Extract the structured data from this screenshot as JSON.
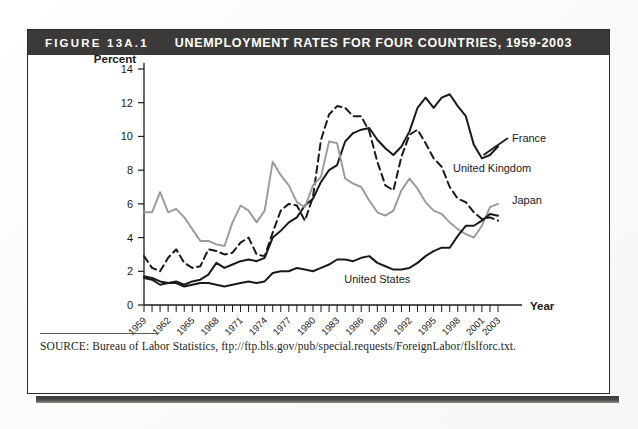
{
  "figure": {
    "number_label": "FIGURE 13A.1",
    "title": "UNEMPLOYMENT RATES FOR FOUR COUNTRIES, 1959-2003",
    "source": "SOURCE: Bureau of Labor Statistics, ftp://ftp.bls.gov/pub/special.requests/ForeignLabor/flslforc.txt."
  },
  "colors": {
    "header_bar": "#3c3a38",
    "header_text": "#ffffff",
    "frame": "#2b2b2b",
    "axis": "#1a1a1a",
    "france": "#1a1a1a",
    "united_kingdom": "#1a1a1a",
    "japan": "#9a9a9a",
    "united_states": "#1a1a1a"
  },
  "chart_data": {
    "type": "line",
    "title": "Unemployment Rates for Four Countries, 1959-2003",
    "xlabel": "Year",
    "ylabel": "Percent",
    "ylim": [
      0,
      14
    ],
    "yticks": [
      0,
      2,
      4,
      6,
      8,
      10,
      12,
      14
    ],
    "xlim": [
      1959,
      2003
    ],
    "xticks": [
      1959,
      1962,
      1965,
      1968,
      1971,
      1974,
      1977,
      1980,
      1983,
      1986,
      1989,
      1992,
      1995,
      1998,
      2001,
      2003
    ],
    "xtick_labels": [
      "1959",
      "1962",
      "1965",
      "1968",
      "1971",
      "1974",
      "1977",
      "1980",
      "1983",
      "1986",
      "1989",
      "1992",
      "1995",
      "1998",
      "2001",
      "2003"
    ],
    "grid": false,
    "legend_position": "inline-right-labels",
    "x": [
      1959,
      1960,
      1961,
      1962,
      1963,
      1964,
      1965,
      1966,
      1967,
      1968,
      1969,
      1970,
      1971,
      1972,
      1973,
      1974,
      1975,
      1976,
      1977,
      1978,
      1979,
      1980,
      1981,
      1982,
      1983,
      1984,
      1985,
      1986,
      1987,
      1988,
      1989,
      1990,
      1991,
      1992,
      1993,
      1994,
      1995,
      1996,
      1997,
      1998,
      1999,
      2000,
      2001,
      2002,
      2003
    ],
    "series": [
      {
        "name": "France",
        "style": "solid",
        "color": "#1a1a1a",
        "label": "France",
        "values": [
          1.6,
          1.5,
          1.2,
          1.3,
          1.4,
          1.2,
          1.4,
          1.5,
          1.8,
          2.5,
          2.2,
          2.4,
          2.6,
          2.7,
          2.6,
          2.8,
          4.0,
          4.4,
          4.9,
          5.2,
          5.9,
          6.3,
          7.3,
          8.0,
          8.3,
          9.7,
          10.2,
          10.4,
          10.5,
          9.8,
          9.3,
          8.9,
          9.4,
          10.3,
          11.7,
          12.3,
          11.7,
          12.3,
          12.5,
          11.8,
          11.2,
          9.5,
          8.7,
          8.9,
          9.4
        ]
      },
      {
        "name": "United Kingdom",
        "style": "dashed",
        "color": "#1a1a1a",
        "label": "United Kingdom",
        "values": [
          2.9,
          2.2,
          2.0,
          2.8,
          3.3,
          2.5,
          2.2,
          2.3,
          3.3,
          3.2,
          3.0,
          3.1,
          3.7,
          4.0,
          3.0,
          2.9,
          4.3,
          5.6,
          6.0,
          5.9,
          5.0,
          6.4,
          9.8,
          11.3,
          11.8,
          11.7,
          11.2,
          11.2,
          10.3,
          8.5,
          7.1,
          6.8,
          8.8,
          10.1,
          10.4,
          9.6,
          8.7,
          8.2,
          7.0,
          6.3,
          6.1,
          5.5,
          5.1,
          5.2,
          5.0
        ]
      },
      {
        "name": "Japan",
        "style": "solid",
        "color": "#9a9a9a",
        "label": "Japan",
        "values": [
          5.5,
          5.5,
          6.7,
          5.5,
          5.7,
          5.2,
          4.5,
          3.8,
          3.8,
          3.6,
          3.5,
          4.9,
          5.9,
          5.6,
          4.9,
          5.6,
          8.5,
          7.7,
          7.1,
          6.1,
          5.8,
          7.1,
          7.6,
          9.7,
          9.6,
          7.5,
          7.2,
          7.0,
          6.2,
          5.5,
          5.3,
          5.6,
          6.8,
          7.5,
          6.9,
          6.1,
          5.6,
          5.4,
          4.9,
          4.5,
          4.2,
          4.0,
          4.7,
          5.8,
          6.0
        ]
      },
      {
        "name": "United States",
        "style": "solid",
        "color": "#1a1a1a",
        "label": "United States",
        "values": [
          1.7,
          1.6,
          1.4,
          1.3,
          1.3,
          1.1,
          1.2,
          1.3,
          1.3,
          1.2,
          1.1,
          1.2,
          1.3,
          1.4,
          1.3,
          1.4,
          1.9,
          2.0,
          2.0,
          2.2,
          2.1,
          2.0,
          2.2,
          2.4,
          2.7,
          2.7,
          2.6,
          2.8,
          2.9,
          2.5,
          2.3,
          2.1,
          2.1,
          2.2,
          2.5,
          2.9,
          3.2,
          3.4,
          3.4,
          4.1,
          4.7,
          4.7,
          5.0,
          5.4,
          5.3
        ]
      }
    ]
  }
}
